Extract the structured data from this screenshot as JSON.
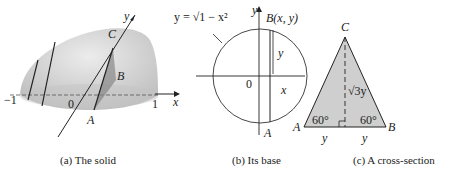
{
  "panels": [
    {
      "id": "a",
      "caption": "(a) The solid",
      "labels": {
        "neg_one": "−1",
        "one": "1",
        "zero": "0",
        "x": "x",
        "y": "y",
        "A": "A",
        "B": "B",
        "C": "C"
      }
    },
    {
      "id": "b",
      "caption": "(b) Its base",
      "labels": {
        "equation": "y = √1 − x²",
        "point_B": "B(x, y)",
        "y_axis": "y",
        "zero": "0",
        "x_axis": "x",
        "x_mark": "x",
        "y_brace": "y",
        "A": "A"
      }
    },
    {
      "id": "c",
      "caption": "(c) A cross-section",
      "labels": {
        "C": "C",
        "A": "A",
        "B": "B",
        "height": "√3y",
        "angle_left": "60°",
        "angle_right": "60°",
        "base_left": "y",
        "base_right": "y"
      }
    }
  ],
  "colors": {
    "fill": "#cfcfcf",
    "line": "#222222"
  }
}
